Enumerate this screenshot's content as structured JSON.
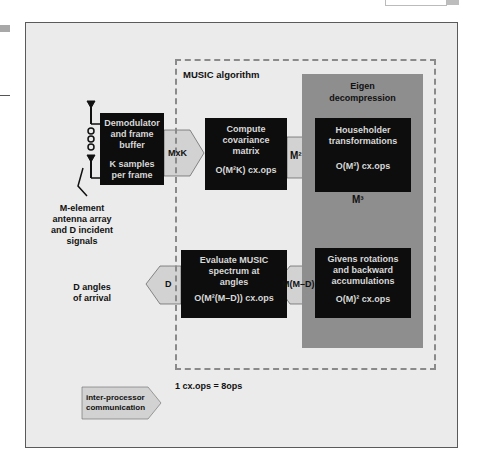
{
  "page": {
    "background": "#ffffff",
    "panel_background": "#ebebeb",
    "eigen_background": "#8e8e8e",
    "block_color": "#0d0d0d",
    "arrow_color": "#d2d2d2"
  },
  "diagram": {
    "title": "MUSIC algorithm",
    "eigen_group": {
      "label_line1": "Eigen",
      "label_line2": "decompression"
    },
    "input": {
      "antenna_label_lines": [
        "M-element",
        "antenna array",
        "and D incident",
        "signals"
      ]
    },
    "blocks": {
      "demodulator": {
        "lines": [
          "Demodulator",
          "and frame",
          "buffer"
        ],
        "sub_lines": [
          "K samples",
          "per frame"
        ]
      },
      "covariance": {
        "lines": [
          "Compute",
          "covariance",
          "matrix"
        ],
        "ops": "O(M²K) cx.ops"
      },
      "householder": {
        "lines": [
          "Householder",
          "transformations"
        ],
        "ops": "O(M³) cx.ops"
      },
      "givens": {
        "lines": [
          "Givens rotations",
          "and backward",
          "accumulations"
        ],
        "ops": "O(M)² cx.ops"
      },
      "evaluate": {
        "lines": [
          "Evaluate MUSIC",
          "spectrum at",
          "angles"
        ],
        "ops": "O(M²(M–D)) cx.ops"
      }
    },
    "arrows": {
      "demod_to_cov": "MxK",
      "cov_to_house": "M²",
      "house_to_givens": "M³",
      "givens_to_eval": "M(M–D)",
      "eval_to_output": "D"
    },
    "output": {
      "label_lines": [
        "D angles",
        "of arrival"
      ]
    },
    "legend": {
      "arrow_label_lines": [
        "inter-processor",
        "communication"
      ],
      "note": "1 cx.ops = 8ops"
    }
  }
}
